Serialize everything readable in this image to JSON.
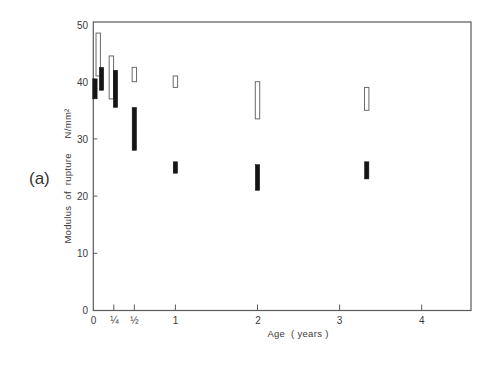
{
  "panel_label": "(a)",
  "chart_data": {
    "type": "bar",
    "subtype": "floating-range-bars",
    "title": "",
    "xlabel": "Age  ( years )",
    "ylabel": "Modulus  of  rupture     N/mm²",
    "xlim": [
      0,
      4.6
    ],
    "ylim": [
      0,
      50
    ],
    "grid": false,
    "legend": null,
    "xticks": [
      0,
      0.25,
      0.5,
      1,
      2,
      3,
      4
    ],
    "xticklabels": [
      "0",
      "¼",
      "½",
      "1",
      "2",
      "3",
      "4"
    ],
    "yticks": [
      0,
      10,
      20,
      30,
      40,
      50
    ],
    "yticklabels": [
      "0",
      "10",
      "20",
      "30",
      "40",
      "50"
    ],
    "series": [
      {
        "name": "open bars",
        "style": "open",
        "color": "#ffffff",
        "points": [
          {
            "age": 0.06,
            "low": 41.0,
            "high": 48.5
          },
          {
            "age": 0.22,
            "low": 37.0,
            "high": 44.5
          },
          {
            "age": 0.5,
            "low": 40.0,
            "high": 42.5
          },
          {
            "age": 1.0,
            "low": 39.0,
            "high": 41.0
          },
          {
            "age": 2.0,
            "low": 33.5,
            "high": 40.0
          },
          {
            "age": 3.33,
            "low": 35.0,
            "high": 39.0
          }
        ]
      },
      {
        "name": "solid bars",
        "style": "solid",
        "color": "#151515",
        "points": [
          {
            "age": 0.02,
            "low": 37.0,
            "high": 40.5
          },
          {
            "age": 0.1,
            "low": 38.5,
            "high": 42.5
          },
          {
            "age": 0.27,
            "low": 35.5,
            "high": 42.0
          },
          {
            "age": 0.5,
            "low": 28.0,
            "high": 35.5
          },
          {
            "age": 1.0,
            "low": 24.0,
            "high": 26.0
          },
          {
            "age": 2.0,
            "low": 21.0,
            "high": 25.5
          },
          {
            "age": 3.33,
            "low": 23.0,
            "high": 26.0
          }
        ]
      }
    ]
  }
}
